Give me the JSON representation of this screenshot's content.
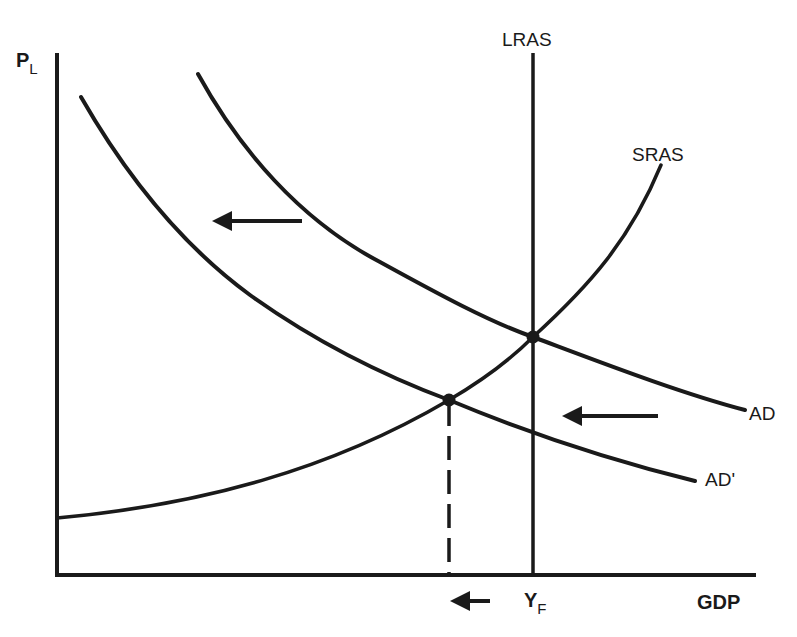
{
  "diagram": {
    "type": "AD-AS macroeconomic model",
    "axes": {
      "y_label_main": "P",
      "y_label_sub": "L",
      "x_label": "GDP",
      "x_marker_main": "Y",
      "x_marker_sub": "F"
    },
    "curves": {
      "lras": "LRAS",
      "sras": "SRAS",
      "ad": "AD",
      "ad_prime": "AD'"
    },
    "equilibria": [
      {
        "name": "initial-equilibrium",
        "description": "AD ∩ SRAS ∩ LRAS at Y_F"
      },
      {
        "name": "new-equilibrium",
        "description": "AD' ∩ SRAS, output below Y_F"
      }
    ],
    "arrows": [
      {
        "name": "ad-shift-arrow-upper",
        "direction": "left"
      },
      {
        "name": "ad-shift-arrow-lower",
        "direction": "left"
      },
      {
        "name": "output-decrease-arrow",
        "direction": "left"
      }
    ],
    "colors": {
      "line": "#1a1a1a",
      "background": "#ffffff"
    }
  }
}
